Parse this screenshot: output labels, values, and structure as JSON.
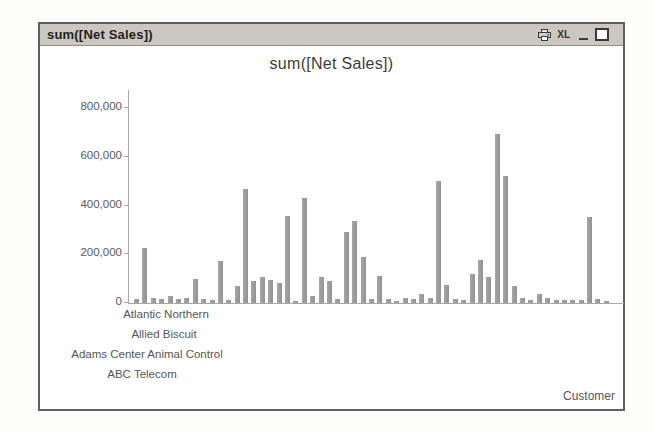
{
  "titlebar": {
    "title": "sum([Net Sales])",
    "icons": [
      {
        "name": "print-icon"
      },
      {
        "name": "excel-export-icon",
        "label": "XL"
      },
      {
        "name": "minimize-icon"
      },
      {
        "name": "maximize-icon"
      }
    ]
  },
  "chart_data": {
    "type": "bar",
    "title": "sum([Net Sales])",
    "series_name": "sum([Net Sales])",
    "xlabel": "Customer",
    "ylabel": "",
    "ylim": [
      0,
      800000
    ],
    "yticks": [
      800000,
      600000,
      400000,
      200000,
      0
    ],
    "ytick_labels": [
      "800,000",
      "600,000",
      "400,000",
      "200,000",
      "0"
    ],
    "grid": "off",
    "legend": "none",
    "bar_color": "#9b9b9b",
    "visible_xtick_labels": [
      "Atlantic Northern",
      "Allied Biscuit",
      "Adams Center Animal Control",
      "ABC Telecom"
    ],
    "values": [
      15000,
      225000,
      20000,
      15000,
      30000,
      15000,
      20000,
      100000,
      15000,
      12000,
      170000,
      12000,
      70000,
      465000,
      90000,
      105000,
      95000,
      80000,
      355000,
      10000,
      430000,
      30000,
      105000,
      90000,
      15000,
      290000,
      335000,
      190000,
      15000,
      110000,
      15000,
      10000,
      20000,
      15000,
      35000,
      20000,
      500000,
      75000,
      15000,
      12000,
      120000,
      175000,
      105000,
      690000,
      520000,
      70000,
      20000,
      12000,
      35000,
      20000,
      12000,
      12000,
      12000,
      12000,
      350000,
      15000,
      8000
    ],
    "note": "Bar values estimated from pixel heights; only the first four x-axis category labels are visible (staggered)."
  }
}
